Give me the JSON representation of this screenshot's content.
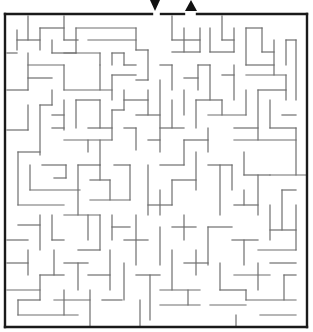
{
  "puzzle": {
    "type": "maze",
    "colors": {
      "wall": "#6e6e6e",
      "border": "#1a1a1a",
      "arrow": "#111111",
      "background": "#ffffff"
    },
    "entrance": {
      "icon": "arrow-down-icon",
      "x": 155,
      "y": 5
    },
    "exit": {
      "icon": "arrow-up-icon",
      "x": 191,
      "y": 5
    },
    "border": [
      [
        5,
        14,
        152,
        14
      ],
      [
        161,
        14,
        184,
        14
      ],
      [
        197,
        14,
        307,
        14
      ],
      [
        307,
        14,
        307,
        327
      ],
      [
        5,
        327,
        307,
        327
      ],
      [
        5,
        14,
        5,
        327
      ]
    ],
    "walls": [
      [
        28,
        16,
        28,
        40
      ],
      [
        17,
        30,
        17,
        50
      ],
      [
        17,
        40,
        40,
        40
      ],
      [
        40,
        28,
        40,
        50
      ],
      [
        40,
        28,
        64,
        28
      ],
      [
        64,
        16,
        64,
        40
      ],
      [
        64,
        40,
        78,
        40
      ],
      [
        76,
        28,
        136,
        28
      ],
      [
        136,
        28,
        136,
        50
      ],
      [
        88,
        40,
        136,
        40
      ],
      [
        76,
        28,
        76,
        53
      ],
      [
        52,
        53,
        76,
        53
      ],
      [
        7,
        53,
        17,
        53
      ],
      [
        52,
        40,
        52,
        53
      ],
      [
        28,
        53,
        28,
        90
      ],
      [
        28,
        65,
        64,
        65
      ],
      [
        64,
        65,
        64,
        90
      ],
      [
        28,
        78,
        52,
        78
      ],
      [
        64,
        53,
        100,
        53
      ],
      [
        100,
        53,
        100,
        65
      ],
      [
        112,
        53,
        112,
        65
      ],
      [
        112,
        53,
        124,
        53
      ],
      [
        124,
        53,
        124,
        65
      ],
      [
        124,
        65,
        136,
        65
      ],
      [
        136,
        50,
        148,
        50
      ],
      [
        148,
        50,
        148,
        80
      ],
      [
        136,
        80,
        148,
        80
      ],
      [
        112,
        75,
        112,
        100
      ],
      [
        112,
        75,
        136,
        75
      ],
      [
        100,
        65,
        100,
        90
      ],
      [
        64,
        90,
        112,
        90
      ],
      [
        7,
        90,
        28,
        90
      ],
      [
        52,
        90,
        52,
        105
      ],
      [
        40,
        105,
        52,
        105
      ],
      [
        28,
        105,
        28,
        130
      ],
      [
        40,
        105,
        40,
        155
      ],
      [
        7,
        130,
        28,
        130
      ],
      [
        52,
        115,
        64,
        115
      ],
      [
        64,
        100,
        64,
        130
      ],
      [
        76,
        100,
        76,
        128
      ],
      [
        76,
        100,
        100,
        100
      ],
      [
        100,
        100,
        100,
        128
      ],
      [
        52,
        128,
        64,
        128
      ],
      [
        88,
        128,
        112,
        128
      ],
      [
        112,
        110,
        112,
        140
      ],
      [
        112,
        110,
        124,
        110
      ],
      [
        124,
        90,
        124,
        110
      ],
      [
        124,
        100,
        148,
        100
      ],
      [
        148,
        90,
        148,
        115
      ],
      [
        136,
        115,
        160,
        115
      ],
      [
        88,
        140,
        88,
        152
      ],
      [
        64,
        140,
        112,
        140
      ],
      [
        124,
        128,
        136,
        128
      ],
      [
        136,
        128,
        136,
        150
      ],
      [
        160,
        80,
        160,
        152
      ],
      [
        148,
        140,
        160,
        140
      ],
      [
        18,
        152,
        40,
        152
      ],
      [
        18,
        152,
        18,
        205
      ],
      [
        18,
        205,
        64,
        205
      ],
      [
        30,
        165,
        30,
        190
      ],
      [
        30,
        190,
        80,
        190
      ],
      [
        42,
        165,
        66,
        165
      ],
      [
        66,
        165,
        66,
        178
      ],
      [
        54,
        178,
        66,
        178
      ],
      [
        78,
        165,
        78,
        215
      ],
      [
        78,
        165,
        100,
        165
      ],
      [
        100,
        165,
        100,
        180
      ],
      [
        90,
        180,
        110,
        180
      ],
      [
        110,
        180,
        110,
        200
      ],
      [
        90,
        200,
        130,
        200
      ],
      [
        130,
        165,
        130,
        200
      ],
      [
        114,
        165,
        130,
        165
      ],
      [
        100,
        140,
        100,
        165
      ],
      [
        172,
        16,
        172,
        40
      ],
      [
        172,
        40,
        200,
        40
      ],
      [
        200,
        28,
        200,
        52
      ],
      [
        172,
        52,
        200,
        52
      ],
      [
        184,
        28,
        184,
        52
      ],
      [
        222,
        16,
        222,
        40
      ],
      [
        222,
        40,
        234,
        40
      ],
      [
        234,
        28,
        234,
        52
      ],
      [
        210,
        52,
        234,
        52
      ],
      [
        210,
        28,
        210,
        52
      ],
      [
        246,
        28,
        262,
        28
      ],
      [
        246,
        28,
        246,
        65
      ],
      [
        262,
        28,
        262,
        52
      ],
      [
        262,
        52,
        274,
        52
      ],
      [
        274,
        40,
        274,
        75
      ],
      [
        286,
        40,
        286,
        65
      ],
      [
        286,
        40,
        296,
        40
      ],
      [
        296,
        40,
        296,
        100
      ],
      [
        246,
        65,
        274,
        65
      ],
      [
        246,
        75,
        286,
        75
      ],
      [
        286,
        75,
        286,
        100
      ],
      [
        234,
        65,
        234,
        100
      ],
      [
        222,
        75,
        234,
        75
      ],
      [
        210,
        65,
        210,
        100
      ],
      [
        198,
        65,
        210,
        65
      ],
      [
        198,
        65,
        198,
        90
      ],
      [
        184,
        78,
        198,
        78
      ],
      [
        172,
        65,
        172,
        90
      ],
      [
        160,
        65,
        172,
        65
      ],
      [
        184,
        90,
        184,
        115
      ],
      [
        172,
        100,
        172,
        128
      ],
      [
        160,
        128,
        184,
        128
      ],
      [
        196,
        100,
        196,
        128
      ],
      [
        196,
        100,
        222,
        100
      ],
      [
        222,
        100,
        222,
        115
      ],
      [
        208,
        115,
        246,
        115
      ],
      [
        246,
        90,
        246,
        115
      ],
      [
        258,
        90,
        286,
        90
      ],
      [
        258,
        90,
        258,
        140
      ],
      [
        234,
        128,
        258,
        128
      ],
      [
        270,
        100,
        270,
        128
      ],
      [
        270,
        128,
        296,
        128
      ],
      [
        282,
        115,
        296,
        115
      ],
      [
        296,
        128,
        296,
        175
      ],
      [
        234,
        140,
        296,
        140
      ],
      [
        208,
        128,
        208,
        152
      ],
      [
        184,
        140,
        208,
        140
      ],
      [
        184,
        140,
        184,
        165
      ],
      [
        160,
        165,
        184,
        165
      ],
      [
        196,
        152,
        196,
        190
      ],
      [
        172,
        180,
        196,
        180
      ],
      [
        172,
        180,
        172,
        205
      ],
      [
        148,
        165,
        148,
        215
      ],
      [
        148,
        205,
        172,
        205
      ],
      [
        160,
        190,
        160,
        215
      ],
      [
        208,
        165,
        232,
        165
      ],
      [
        220,
        165,
        220,
        215
      ],
      [
        232,
        165,
        232,
        190
      ],
      [
        244,
        152,
        244,
        175
      ],
      [
        244,
        175,
        270,
        175
      ],
      [
        258,
        175,
        258,
        215
      ],
      [
        270,
        175,
        306,
        175
      ],
      [
        282,
        190,
        282,
        230
      ],
      [
        282,
        190,
        296,
        190
      ],
      [
        234,
        205,
        258,
        205
      ],
      [
        244,
        190,
        244,
        205
      ],
      [
        270,
        205,
        270,
        240
      ],
      [
        270,
        230,
        296,
        230
      ],
      [
        296,
        205,
        296,
        250
      ],
      [
        18,
        225,
        40,
        225
      ],
      [
        40,
        215,
        40,
        250
      ],
      [
        52,
        215,
        52,
        240
      ],
      [
        52,
        240,
        64,
        240
      ],
      [
        64,
        215,
        100,
        215
      ],
      [
        88,
        215,
        88,
        240
      ],
      [
        100,
        215,
        100,
        250
      ],
      [
        78,
        250,
        100,
        250
      ],
      [
        112,
        215,
        112,
        240
      ],
      [
        112,
        227,
        130,
        227
      ],
      [
        124,
        240,
        148,
        240
      ],
      [
        136,
        215,
        136,
        265
      ],
      [
        160,
        227,
        160,
        265
      ],
      [
        172,
        227,
        196,
        227
      ],
      [
        184,
        215,
        184,
        240
      ],
      [
        208,
        227,
        208,
        265
      ],
      [
        208,
        227,
        232,
        227
      ],
      [
        232,
        240,
        258,
        240
      ],
      [
        244,
        240,
        244,
        265
      ],
      [
        258,
        250,
        296,
        250
      ],
      [
        7,
        240,
        28,
        240
      ],
      [
        28,
        250,
        28,
        275
      ],
      [
        7,
        263,
        28,
        263
      ],
      [
        40,
        275,
        64,
        275
      ],
      [
        54,
        250,
        54,
        275
      ],
      [
        64,
        263,
        88,
        263
      ],
      [
        78,
        263,
        78,
        290
      ],
      [
        88,
        275,
        110,
        275
      ],
      [
        110,
        250,
        110,
        290
      ],
      [
        124,
        263,
        124,
        300
      ],
      [
        136,
        275,
        160,
        275
      ],
      [
        150,
        275,
        150,
        320
      ],
      [
        160,
        290,
        200,
        290
      ],
      [
        172,
        250,
        172,
        290
      ],
      [
        184,
        263,
        208,
        263
      ],
      [
        196,
        250,
        196,
        275
      ],
      [
        220,
        263,
        220,
        290
      ],
      [
        220,
        290,
        246,
        290
      ],
      [
        234,
        275,
        270,
        275
      ],
      [
        258,
        263,
        258,
        290
      ],
      [
        270,
        263,
        296,
        263
      ],
      [
        284,
        275,
        296,
        275
      ],
      [
        284,
        275,
        284,
        300
      ],
      [
        246,
        300,
        296,
        300
      ],
      [
        246,
        290,
        246,
        300
      ],
      [
        7,
        290,
        40,
        290
      ],
      [
        40,
        275,
        40,
        300
      ],
      [
        18,
        300,
        40,
        300
      ],
      [
        18,
        300,
        18,
        315
      ],
      [
        18,
        315,
        78,
        315
      ],
      [
        54,
        300,
        90,
        300
      ],
      [
        90,
        290,
        90,
        327
      ],
      [
        64,
        290,
        64,
        315
      ],
      [
        102,
        300,
        122,
        300
      ],
      [
        140,
        300,
        140,
        327
      ],
      [
        160,
        305,
        200,
        305
      ],
      [
        188,
        290,
        188,
        305
      ],
      [
        210,
        305,
        246,
        305
      ],
      [
        236,
        315,
        236,
        327
      ],
      [
        260,
        315,
        296,
        315
      ]
    ]
  }
}
